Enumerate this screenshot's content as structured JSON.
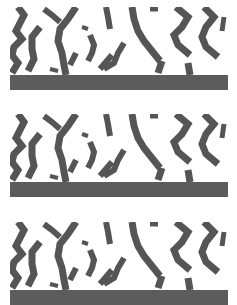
{
  "figure": {
    "colors": {
      "background": "#ffffff",
      "stripe": "#555555",
      "bar": "#5c5c5c"
    },
    "panel_width": 218,
    "pattern_height": 68,
    "bar_height": 15,
    "panels": [
      {
        "id": "panel-1",
        "top": 7,
        "bar_height": 15
      },
      {
        "id": "panel-2",
        "top": 114,
        "bar_height": 15
      },
      {
        "id": "panel-3",
        "top": 222,
        "bar_height": 15
      }
    ],
    "stripes": [
      {
        "w": 7,
        "pts": "8,0 14,8 10,16 6,24 12,32 4,40 2,48 8,56 2,66"
      },
      {
        "w": 7,
        "pts": "30,20 22,30 22,42 24,52 18,64"
      },
      {
        "w": 6,
        "pts": "34,2 42,8 50,15"
      },
      {
        "w": 7,
        "pts": "66,0 58,12 50,22 48,34 52,46 54,58 56,68"
      },
      {
        "w": 6,
        "pts": "80,28 84,38 82,46 78,54"
      },
      {
        "w": 6,
        "pts": "96,0 98,10 100,22"
      },
      {
        "w": 6,
        "pts": "114,36 108,46 104,56 94,62"
      },
      {
        "w": 7,
        "pts": "122,0 124,12 128,24 134,34 142,44 150,54"
      },
      {
        "w": 5,
        "pts": "140,2 148,2"
      },
      {
        "w": 7,
        "pts": "166,0 178,10 172,20 164,28 168,38 180,48"
      },
      {
        "w": 7,
        "pts": "194,0 204,10 196,20 192,30 196,40 208,50"
      },
      {
        "w": 5,
        "pts": "214,10 212,24"
      },
      {
        "w": 7,
        "pts": "152,54 148,66"
      },
      {
        "w": 7,
        "pts": "178,56 180,68"
      },
      {
        "w": 6,
        "pts": "66,46 60,58"
      },
      {
        "w": 6,
        "pts": "102,48 90,62"
      },
      {
        "w": 4,
        "pts": "72,20 78,22"
      },
      {
        "w": 4,
        "pts": "40,62 48,64"
      }
    ]
  }
}
